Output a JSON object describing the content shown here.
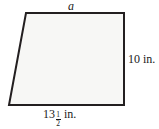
{
  "figure": {
    "name": "trapezoid-figure",
    "shape_type": "trapezoid",
    "fill_color": "#f7f7f5",
    "stroke_color": "#231f20",
    "stroke_width": 2,
    "background_color": "#ffffff",
    "vertices": {
      "top_left": [
        26,
        13
      ],
      "top_right": [
        124,
        13
      ],
      "bottom_right": [
        124,
        105
      ],
      "bottom_left": [
        9,
        105
      ]
    },
    "labels": {
      "top": {
        "text": "a",
        "style": "italic",
        "meaning": "unknown-top-side-length"
      },
      "right": {
        "text": "10 in.",
        "value": 10,
        "unit": "in.",
        "meaning": "right-side-height"
      },
      "bottom": {
        "whole": "13",
        "numerator": "1",
        "denominator": "2",
        "unit": "in.",
        "full_text": "13 1/2 in.",
        "value": 13.5,
        "meaning": "bottom-side-length"
      }
    }
  }
}
